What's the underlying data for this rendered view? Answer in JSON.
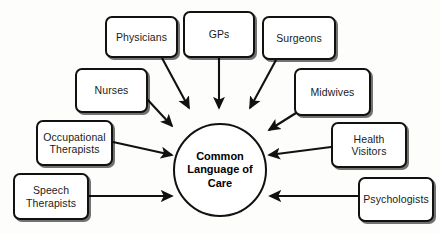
{
  "diagram": {
    "title": "Common Language of Care",
    "background_color": "#fdfdfb",
    "line_color": "#111111",
    "box_fill": "#ffffff",
    "hub": {
      "label_line_1": "Common",
      "label_line_2": "Language",
      "label_line_3": "of Care",
      "shape": "circle",
      "cx": 220,
      "cy": 170,
      "r": 47
    },
    "nodes": [
      {
        "id": "physicians",
        "label": "Physicians",
        "line_1": "Physicians",
        "line_2": "",
        "x": 105,
        "y": 16,
        "w": 73,
        "h": 42
      },
      {
        "id": "gps",
        "label": "GPs",
        "line_1": "GPs",
        "line_2": "",
        "x": 183,
        "y": 11,
        "w": 72,
        "h": 47
      },
      {
        "id": "surgeons",
        "label": "Surgeons",
        "line_1": "Surgeons",
        "line_2": "",
        "x": 262,
        "y": 16,
        "w": 74,
        "h": 44
      },
      {
        "id": "nurses",
        "label": "Nurses",
        "line_1": "Nurses",
        "line_2": "",
        "x": 75,
        "y": 68,
        "w": 73,
        "h": 45
      },
      {
        "id": "midwives",
        "label": "Midwives",
        "line_1": "Midwives",
        "line_2": "",
        "x": 294,
        "y": 68,
        "w": 77,
        "h": 48
      },
      {
        "id": "occupational-therapists",
        "label": "Occupational Therapists",
        "line_1": "Occupational",
        "line_2": "Therapists",
        "x": 36,
        "y": 120,
        "w": 77,
        "h": 46
      },
      {
        "id": "health-visitors",
        "label": "Health Visitors",
        "line_1": "Health",
        "line_2": "Visitors",
        "x": 331,
        "y": 122,
        "w": 76,
        "h": 46
      },
      {
        "id": "speech-therapists",
        "label": "Speech Therapists",
        "line_1": "Speech",
        "line_2": "Therapists",
        "x": 13,
        "y": 173,
        "w": 76,
        "h": 47
      },
      {
        "id": "psychologists",
        "label": "Psychologists",
        "line_1": "Psychologists",
        "line_2": "",
        "x": 358,
        "y": 177,
        "w": 76,
        "h": 45
      }
    ],
    "arrows": [
      {
        "id": "arrow-physicians-to-hub",
        "from": "physicians",
        "to": "hub",
        "x1": 162,
        "y1": 58,
        "x2": 189,
        "y2": 108
      },
      {
        "id": "arrow-gps-to-hub",
        "from": "gps",
        "to": "hub",
        "x1": 219,
        "y1": 58,
        "x2": 219,
        "y2": 108
      },
      {
        "id": "arrow-surgeons-to-hub",
        "from": "surgeons",
        "to": "hub",
        "x1": 276,
        "y1": 60,
        "x2": 250,
        "y2": 108
      },
      {
        "id": "arrow-nurses-to-hub",
        "from": "nurses",
        "to": "hub",
        "x1": 146,
        "y1": 98,
        "x2": 172,
        "y2": 126
      },
      {
        "id": "arrow-midwives-to-hub",
        "from": "midwives",
        "to": "hub",
        "x1": 296,
        "y1": 113,
        "x2": 269,
        "y2": 130
      },
      {
        "id": "arrow-occupational-therapists-to-hub",
        "from": "occupational-therapists",
        "to": "hub",
        "x1": 113,
        "y1": 142,
        "x2": 172,
        "y2": 155
      },
      {
        "id": "arrow-speech-therapists-to-hub",
        "from": "speech-therapists",
        "to": "hub",
        "x1": 89,
        "y1": 196,
        "x2": 172,
        "y2": 196
      },
      {
        "id": "arrow-health-visitors-to-hub",
        "from": "health-visitors",
        "to": "hub",
        "x1": 331,
        "y1": 147,
        "x2": 269,
        "y2": 155
      },
      {
        "id": "arrow-psychologists-to-hub",
        "from": "psychologists",
        "to": "hub",
        "x1": 358,
        "y1": 196,
        "x2": 270,
        "y2": 196
      }
    ]
  }
}
